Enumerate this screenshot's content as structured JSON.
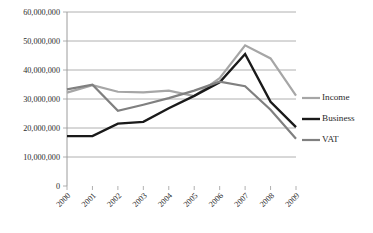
{
  "chart_data": {
    "type": "line",
    "title": "",
    "xlabel": "",
    "ylabel": "",
    "categories": [
      "2000",
      "2001",
      "2002",
      "2003",
      "2004",
      "2005",
      "2006",
      "2007",
      "2008",
      "2009"
    ],
    "ylim": [
      0,
      60000000
    ],
    "yticks": [
      0,
      10000000,
      20000000,
      30000000,
      40000000,
      50000000,
      60000000
    ],
    "ytick_labels": [
      "0",
      "10,000,000",
      "20,000,000",
      "30,000,000",
      "40,000,000",
      "50,000,000",
      "60,000,000"
    ],
    "grid": true,
    "legend_position": "right",
    "series": [
      {
        "name": "Income",
        "color": "#a6a6a6",
        "width": 2.2,
        "values": [
          32200000,
          34800000,
          32500000,
          32300000,
          32900000,
          31000000,
          37200000,
          48500000,
          44000000,
          31200000
        ]
      },
      {
        "name": "Business",
        "color": "#1a1a1a",
        "width": 2.4,
        "values": [
          17200000,
          17200000,
          21500000,
          22100000,
          26800000,
          31100000,
          35800000,
          45500000,
          29000000,
          20300000
        ]
      },
      {
        "name": "VAT",
        "color": "#808080",
        "width": 2.2,
        "values": [
          33300000,
          34900000,
          25900000,
          28000000,
          30300000,
          32900000,
          36000000,
          34400000,
          26300000,
          16300000
        ]
      }
    ]
  },
  "legend": {
    "items": [
      {
        "label": "Income",
        "color": "#a6a6a6"
      },
      {
        "label": "Business",
        "color": "#1a1a1a"
      },
      {
        "label": "VAT",
        "color": "#808080"
      }
    ]
  }
}
